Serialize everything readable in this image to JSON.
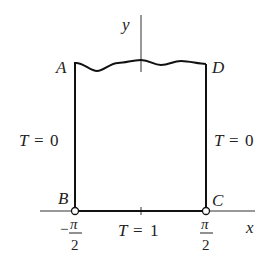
{
  "diagram": {
    "axes": {
      "x_label": "x",
      "y_label": "y"
    },
    "corners": {
      "A": "A",
      "B": "B",
      "C": "C",
      "D": "D"
    },
    "boundary_conditions": {
      "left": {
        "var": "T",
        "eq": "=",
        "val": "0"
      },
      "right": {
        "var": "T",
        "eq": "=",
        "val": "0"
      },
      "bottom": {
        "var": "T",
        "eq": "=",
        "val": "1"
      }
    },
    "ticks": {
      "left": {
        "sign": "−",
        "num": "π",
        "den": "2"
      },
      "right": {
        "num": "π",
        "den": "2"
      }
    }
  }
}
